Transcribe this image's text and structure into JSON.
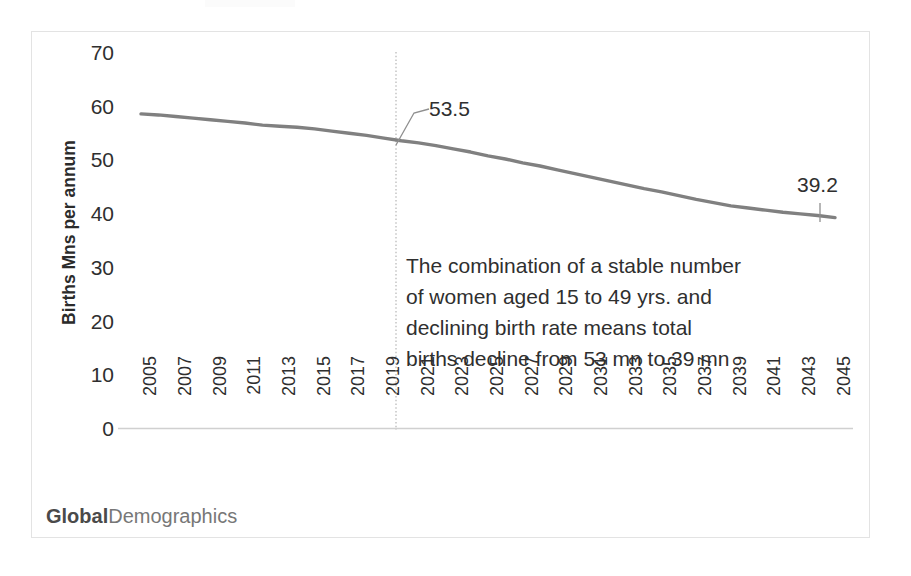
{
  "brand": {
    "part_bold": "Global",
    "part_regular": "Demographics"
  },
  "annotation": {
    "line1": "The combination of a stable number",
    "line2": "of women aged 15 to 49 yrs. and",
    "line3": "declining birth rate means total",
    "line4": "births decline from 53 mn to 39 mn"
  },
  "labels": {
    "start_value": "53.5",
    "end_value": "39.2"
  },
  "colors": {
    "series_line": "#808080",
    "marker_line": "#9a9a9a",
    "axis": "#d0d0d0",
    "text": "#2f2f2f",
    "frame": "#e3e3e3"
  },
  "chart_data": {
    "type": "line",
    "title": "",
    "xlabel": "",
    "ylabel": "Births Mns per annum",
    "ylim": [
      0,
      70
    ],
    "ytick_values": [
      0,
      10,
      20,
      30,
      40,
      50,
      60,
      70
    ],
    "ytick_labels": [
      "0",
      "10",
      "20",
      "30",
      "40",
      "50",
      "60",
      "70"
    ],
    "xlim": [
      2005,
      2045
    ],
    "xtick_labels": [
      "2005",
      "2007",
      "2009",
      "2011",
      "2013",
      "2015",
      "2017",
      "2019",
      "2021",
      "2023",
      "2025",
      "2027",
      "2029",
      "2031",
      "2033",
      "2035",
      "2037",
      "2039",
      "2041",
      "2043",
      "2045"
    ],
    "grid": false,
    "legend": "none",
    "annotations": [
      {
        "text": "53.5",
        "x": 2020,
        "y": 53.5,
        "type": "callout"
      },
      {
        "text": "39.2",
        "x": 2045,
        "y": 39.2,
        "type": "callout"
      },
      {
        "text": "The combination of a stable number of women aged 15 to 49 yrs. and declining birth rate means total births decline from 53 mn to 39 mn",
        "type": "text-block"
      }
    ],
    "reference_line": {
      "x": 2020,
      "style": "dotted",
      "label": ""
    },
    "series": [
      {
        "name": "Births per annum (Mns)",
        "x": [
          2005,
          2006,
          2007,
          2008,
          2009,
          2010,
          2011,
          2012,
          2013,
          2014,
          2015,
          2016,
          2017,
          2018,
          2019,
          2020,
          2021,
          2022,
          2023,
          2024,
          2025,
          2026,
          2027,
          2028,
          2029,
          2030,
          2031,
          2032,
          2033,
          2034,
          2035,
          2036,
          2037,
          2038,
          2039,
          2040,
          2041,
          2042,
          2043,
          2044,
          2045
        ],
        "values": [
          58.5,
          58.3,
          58.0,
          57.7,
          57.4,
          57.1,
          56.8,
          56.4,
          56.2,
          56.0,
          55.7,
          55.3,
          54.9,
          54.5,
          54.0,
          53.5,
          53.1,
          52.6,
          52.0,
          51.4,
          50.7,
          50.1,
          49.4,
          48.8,
          48.1,
          47.4,
          46.7,
          46.0,
          45.3,
          44.6,
          44.0,
          43.3,
          42.6,
          42.0,
          41.4,
          41.0,
          40.6,
          40.2,
          39.9,
          39.6,
          39.2
        ]
      }
    ]
  }
}
